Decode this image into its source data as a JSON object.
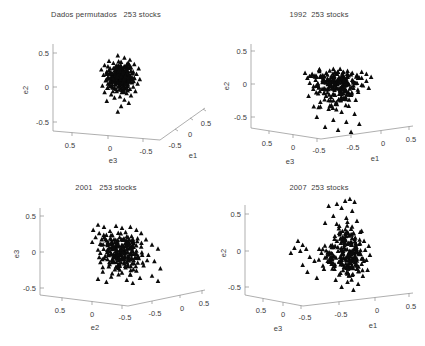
{
  "figure": {
    "background": "#ffffff",
    "marker_color": "#0a0a0a",
    "axis_color": "#8c8c8c",
    "text_color": "#3d3d3d",
    "marker_shape": "triangle",
    "n_panels": 4
  },
  "panels": [
    {
      "id": "panel-permuted",
      "title": "Dados permutados   253 stocks",
      "label_prefix": "Dados permutados",
      "count_label": "253 stocks",
      "vertical_axis_label": "e2",
      "left_axis_label": "e3",
      "right_axis_label": "e1",
      "vertical_ticks": [
        "0.5",
        "0",
        "-0.5"
      ],
      "left_ticks": [
        "0.5",
        "0",
        "-0.5"
      ],
      "right_ticks": [
        "-0.5",
        "0",
        "0.5"
      ],
      "right_axis_direction": "up-right"
    },
    {
      "id": "panel-1992",
      "title": "1992  253 stocks",
      "label_prefix": "1992",
      "count_label": "253 stocks",
      "vertical_axis_label": "e2",
      "left_axis_label": "e3",
      "right_axis_label": "e1",
      "vertical_ticks": [
        "0.5",
        "0",
        "-0.5"
      ],
      "left_ticks": [
        "0.5",
        "0",
        "-0.5"
      ],
      "right_ticks": [
        "-0.5",
        "0",
        "0.5"
      ],
      "right_axis_direction": "up-right-shallow"
    },
    {
      "id": "panel-2001",
      "title": "2001   253 stocks",
      "label_prefix": "2001",
      "count_label": "253 stocks",
      "vertical_axis_label": "e3",
      "left_axis_label": "e2",
      "right_axis_label": "",
      "vertical_ticks": [
        "0.5",
        "0",
        "-0.5"
      ],
      "left_ticks": [
        "0.5",
        "0",
        "-0.5"
      ],
      "right_ticks": [
        "-0.5",
        "0",
        "0.5"
      ],
      "right_axis_direction": "up-right-shallow"
    },
    {
      "id": "panel-2007",
      "title": "2007  253 stocks",
      "label_prefix": "2007",
      "count_label": "253 stocks",
      "vertical_axis_label": "e2",
      "left_axis_label": "e3",
      "right_axis_label": "e1",
      "vertical_ticks": [
        "0.5",
        "0",
        "-0.5"
      ],
      "left_ticks": [
        "0.5",
        "0",
        "-0.5"
      ],
      "right_ticks": [
        "-0.5",
        "0",
        "0.5"
      ],
      "right_axis_direction": "up-right-shallow"
    }
  ],
  "chart_data": {
    "type": "scatter",
    "subplots": 4,
    "marker": "triangle",
    "axis_range": [
      -0.7,
      0.7
    ],
    "tick_values": [
      -0.5,
      0,
      0.5
    ],
    "grid": false,
    "legend": "none",
    "projection": "3d",
    "panels": [
      {
        "name": "Dados permutados   253 stocks",
        "n_points": 253,
        "xlabel": "e3",
        "ylabel": "e2",
        "zlabel": "e1",
        "description": "tight isotropic spherical cluster centered near origin",
        "cluster_center": [
          0.0,
          0.12
        ],
        "cluster_spread": [
          0.13,
          0.11
        ],
        "points": [
          [
            -0.02,
            0.3
          ],
          [
            0.04,
            0.28
          ],
          [
            -0.1,
            0.25
          ],
          [
            0.09,
            0.26
          ],
          [
            0.01,
            0.24
          ],
          [
            -0.06,
            0.23
          ],
          [
            0.13,
            0.22
          ],
          [
            -0.14,
            0.21
          ],
          [
            0.06,
            0.21
          ],
          [
            0.0,
            0.2
          ],
          [
            -0.03,
            0.19
          ],
          [
            0.1,
            0.19
          ],
          [
            -0.09,
            0.18
          ],
          [
            0.17,
            0.18
          ],
          [
            0.03,
            0.17
          ],
          [
            -0.17,
            0.17
          ],
          [
            0.07,
            0.16
          ],
          [
            -0.05,
            0.16
          ],
          [
            0.12,
            0.15
          ],
          [
            -0.12,
            0.15
          ],
          [
            0.0,
            0.14
          ],
          [
            0.05,
            0.14
          ],
          [
            -0.08,
            0.13
          ],
          [
            0.15,
            0.13
          ],
          [
            0.02,
            0.12
          ],
          [
            -0.15,
            0.12
          ],
          [
            0.09,
            0.11
          ],
          [
            -0.02,
            0.11
          ],
          [
            0.06,
            0.1
          ],
          [
            -0.11,
            0.1
          ],
          [
            0.13,
            0.09
          ],
          [
            0.01,
            0.09
          ],
          [
            -0.06,
            0.08
          ],
          [
            0.18,
            0.08
          ],
          [
            0.04,
            0.07
          ],
          [
            -0.13,
            0.07
          ],
          [
            0.08,
            0.06
          ],
          [
            -0.01,
            0.06
          ],
          [
            0.11,
            0.05
          ],
          [
            -0.09,
            0.05
          ],
          [
            0.03,
            0.04
          ],
          [
            0.16,
            0.04
          ],
          [
            -0.04,
            0.03
          ],
          [
            0.07,
            0.03
          ],
          [
            -0.16,
            0.02
          ],
          [
            0.0,
            0.02
          ],
          [
            0.12,
            0.01
          ],
          [
            -0.07,
            0.01
          ],
          [
            0.05,
            0.0
          ],
          [
            -0.11,
            0.0
          ],
          [
            0.09,
            -0.01
          ],
          [
            0.02,
            -0.02
          ],
          [
            -0.03,
            -0.03
          ],
          [
            0.14,
            -0.03
          ],
          [
            -0.14,
            -0.04
          ],
          [
            0.06,
            -0.05
          ],
          [
            -0.08,
            -0.06
          ],
          [
            0.1,
            -0.07
          ],
          [
            0.0,
            -0.08
          ],
          [
            -0.05,
            -0.09
          ],
          [
            0.04,
            -0.11
          ],
          [
            -0.12,
            -0.12
          ],
          [
            0.08,
            -0.14
          ],
          [
            0.01,
            -0.17
          ],
          [
            -0.02,
            -0.22
          ]
        ]
      },
      {
        "name": "1992  253 stocks",
        "n_points": 253,
        "xlabel": "e3",
        "ylabel": "e2",
        "zlabel": "e1",
        "description": "broad horizontally elongated cloud, denser near e2 = 0, tail downward to -0.5",
        "cluster_center": [
          0.02,
          0.02
        ],
        "cluster_spread": [
          0.22,
          0.15
        ],
        "points": [
          [
            -0.1,
            0.14
          ],
          [
            0.02,
            0.15
          ],
          [
            0.14,
            0.13
          ],
          [
            0.26,
            0.12
          ],
          [
            -0.22,
            0.11
          ],
          [
            0.06,
            0.12
          ],
          [
            0.18,
            0.11
          ],
          [
            -0.04,
            0.11
          ],
          [
            0.3,
            0.1
          ],
          [
            -0.16,
            0.1
          ],
          [
            0.1,
            0.09
          ],
          [
            0.22,
            0.09
          ],
          [
            -0.09,
            0.08
          ],
          [
            0.02,
            0.08
          ],
          [
            0.34,
            0.07
          ],
          [
            0.14,
            0.07
          ],
          [
            -0.2,
            0.06
          ],
          [
            0.26,
            0.06
          ],
          [
            -0.03,
            0.05
          ],
          [
            0.07,
            0.05
          ],
          [
            0.18,
            0.04
          ],
          [
            -0.13,
            0.04
          ],
          [
            0.3,
            0.03
          ],
          [
            0.01,
            0.03
          ],
          [
            0.11,
            0.02
          ],
          [
            -0.07,
            0.02
          ],
          [
            0.22,
            0.01
          ],
          [
            -0.18,
            0.01
          ],
          [
            0.05,
            0.0
          ],
          [
            0.15,
            0.0
          ],
          [
            0.26,
            -0.01
          ],
          [
            -0.11,
            -0.02
          ],
          [
            -0.01,
            -0.02
          ],
          [
            0.09,
            -0.03
          ],
          [
            0.19,
            -0.04
          ],
          [
            0.32,
            -0.04
          ],
          [
            -0.15,
            -0.05
          ],
          [
            0.03,
            -0.06
          ],
          [
            0.13,
            -0.07
          ],
          [
            0.23,
            -0.08
          ],
          [
            -0.06,
            -0.09
          ],
          [
            0.07,
            -0.1
          ],
          [
            0.17,
            -0.11
          ],
          [
            -0.19,
            -0.12
          ],
          [
            0.0,
            -0.13
          ],
          [
            0.11,
            -0.15
          ],
          [
            0.21,
            -0.16
          ],
          [
            -0.09,
            -0.18
          ],
          [
            0.04,
            -0.2
          ],
          [
            0.15,
            -0.22
          ],
          [
            -0.02,
            -0.25
          ],
          [
            0.09,
            -0.28
          ],
          [
            0.2,
            -0.3
          ],
          [
            -0.12,
            -0.33
          ],
          [
            0.02,
            -0.36
          ],
          [
            0.13,
            -0.38
          ],
          [
            0.24,
            -0.4
          ],
          [
            -0.05,
            -0.43
          ],
          [
            0.06,
            -0.46
          ],
          [
            0.17,
            -0.48
          ]
        ]
      },
      {
        "name": "2001   253 stocks",
        "n_points": 253,
        "xlabel": "e2",
        "ylabel": "e3",
        "zlabel": "e1",
        "description": "central dense blob with satellite sub-clusters to upper-left and scattered outliers to the right",
        "cluster_center": [
          -0.02,
          0.0
        ],
        "cluster_spread": [
          0.2,
          0.18
        ],
        "points": [
          [
            -0.2,
            0.27
          ],
          [
            -0.15,
            0.25
          ],
          [
            -0.24,
            0.22
          ],
          [
            -0.05,
            0.26
          ],
          [
            0.0,
            0.24
          ],
          [
            0.07,
            0.25
          ],
          [
            -0.1,
            0.21
          ],
          [
            0.12,
            0.22
          ],
          [
            -0.19,
            0.19
          ],
          [
            0.03,
            0.2
          ],
          [
            0.16,
            0.19
          ],
          [
            -0.08,
            0.17
          ],
          [
            0.08,
            0.16
          ],
          [
            -0.22,
            0.15
          ],
          [
            -0.02,
            0.15
          ],
          [
            0.13,
            0.14
          ],
          [
            0.2,
            0.13
          ],
          [
            -0.13,
            0.12
          ],
          [
            0.04,
            0.12
          ],
          [
            -0.06,
            0.1
          ],
          [
            0.1,
            0.09
          ],
          [
            0.25,
            0.08
          ],
          [
            -0.17,
            0.08
          ],
          [
            0.0,
            0.07
          ],
          [
            0.16,
            0.06
          ],
          [
            -0.1,
            0.05
          ],
          [
            0.06,
            0.05
          ],
          [
            0.3,
            0.04
          ],
          [
            -0.2,
            0.03
          ],
          [
            0.02,
            0.02
          ],
          [
            0.12,
            0.02
          ],
          [
            -0.05,
            0.0
          ],
          [
            0.08,
            -0.01
          ],
          [
            0.22,
            -0.02
          ],
          [
            -0.14,
            -0.03
          ],
          [
            0.0,
            -0.04
          ],
          [
            0.14,
            -0.05
          ],
          [
            -0.08,
            -0.06
          ],
          [
            0.05,
            -0.07
          ],
          [
            0.27,
            -0.08
          ],
          [
            -0.18,
            -0.09
          ],
          [
            0.1,
            -0.1
          ],
          [
            -0.02,
            -0.11
          ],
          [
            0.18,
            -0.12
          ],
          [
            -0.11,
            -0.13
          ],
          [
            0.03,
            -0.14
          ],
          [
            0.32,
            -0.15
          ],
          [
            -0.06,
            -0.16
          ],
          [
            0.12,
            -0.17
          ],
          [
            -0.16,
            -0.18
          ],
          [
            0.0,
            -0.19
          ],
          [
            0.07,
            -0.21
          ],
          [
            0.25,
            -0.22
          ],
          [
            -0.09,
            -0.23
          ],
          [
            0.15,
            -0.24
          ],
          [
            -0.2,
            -0.25
          ],
          [
            0.04,
            -0.26
          ],
          [
            0.3,
            -0.27
          ],
          [
            -0.13,
            -0.28
          ],
          [
            0.09,
            -0.29
          ]
        ]
      },
      {
        "name": "2007  253 stocks",
        "n_points": 253,
        "xlabel": "e3",
        "ylabel": "e2",
        "zlabel": "e1",
        "description": "dense right-hand blob near e2 = -0.1 with a sparse arc of outliers sweeping up-left toward e2 = 0.5",
        "cluster_center": [
          0.16,
          -0.08
        ],
        "cluster_spread": [
          0.12,
          0.16
        ],
        "points": [
          [
            0.12,
            0.5
          ],
          [
            0.16,
            0.52
          ],
          [
            0.2,
            0.49
          ],
          [
            0.05,
            0.47
          ],
          [
            -0.02,
            0.45
          ],
          [
            0.09,
            0.43
          ],
          [
            0.18,
            0.4
          ],
          [
            0.02,
            0.35
          ],
          [
            0.13,
            0.33
          ],
          [
            0.22,
            0.3
          ],
          [
            -0.05,
            0.28
          ],
          [
            0.07,
            0.25
          ],
          [
            0.17,
            0.22
          ],
          [
            0.26,
            0.2
          ],
          [
            -0.28,
            0.1
          ],
          [
            -0.24,
            0.06
          ],
          [
            -0.31,
            0.03
          ],
          [
            -0.26,
            0.0
          ],
          [
            -0.21,
            0.02
          ],
          [
            -0.34,
            -0.02
          ],
          [
            0.1,
            0.14
          ],
          [
            0.2,
            0.12
          ],
          [
            0.28,
            0.1
          ],
          [
            0.05,
            0.1
          ],
          [
            0.15,
            0.08
          ],
          [
            0.24,
            0.07
          ],
          [
            0.32,
            0.05
          ],
          [
            0.01,
            0.06
          ],
          [
            0.11,
            0.04
          ],
          [
            0.2,
            0.03
          ],
          [
            0.29,
            0.01
          ],
          [
            -0.1,
            0.02
          ],
          [
            0.06,
            0.0
          ],
          [
            0.16,
            -0.01
          ],
          [
            0.25,
            -0.03
          ],
          [
            0.33,
            -0.04
          ],
          [
            -0.18,
            -0.06
          ],
          [
            0.02,
            -0.05
          ],
          [
            0.12,
            -0.07
          ],
          [
            0.21,
            -0.08
          ],
          [
            0.3,
            -0.09
          ],
          [
            -0.14,
            -0.1
          ],
          [
            0.07,
            -0.11
          ],
          [
            0.17,
            -0.12
          ],
          [
            0.26,
            -0.13
          ],
          [
            -0.24,
            -0.14
          ],
          [
            0.03,
            -0.15
          ],
          [
            0.13,
            -0.17
          ],
          [
            0.22,
            -0.18
          ],
          [
            0.31,
            -0.19
          ],
          [
            -0.2,
            -0.21
          ],
          [
            0.08,
            -0.22
          ],
          [
            0.18,
            -0.24
          ],
          [
            0.27,
            -0.25
          ],
          [
            -0.12,
            -0.27
          ],
          [
            0.04,
            -0.29
          ],
          [
            0.14,
            -0.31
          ],
          [
            0.23,
            -0.33
          ],
          [
            0.09,
            -0.36
          ],
          [
            0.19,
            -0.39
          ]
        ]
      }
    ]
  }
}
